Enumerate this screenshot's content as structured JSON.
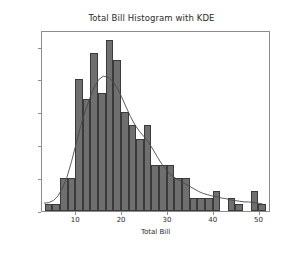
{
  "chart_data": {
    "type": "bar",
    "title": "Total Bill Histogram with KDE",
    "xlabel": "Total Bill",
    "ylabel": "Frequency",
    "xlim": [
      2.5,
      52.5
    ],
    "ylim": [
      0,
      27.5
    ],
    "xticks": [
      10,
      20,
      30,
      40,
      50
    ],
    "yticks": [
      0,
      5,
      10,
      15,
      20,
      25
    ],
    "grid": false,
    "legend": null,
    "bin_width": 1.667,
    "bin_edges": [
      3.07,
      4.74,
      6.4,
      8.07,
      9.74,
      11.4,
      13.07,
      14.74,
      16.4,
      18.07,
      19.74,
      21.4,
      23.07,
      24.74,
      26.4,
      28.07,
      29.74,
      31.4,
      33.07,
      34.74,
      36.4,
      38.07,
      39.74,
      41.4,
      43.07,
      44.74,
      46.4,
      48.07,
      49.74,
      51.4
    ],
    "categories": [
      "3.9",
      "5.6",
      "7.2",
      "8.9",
      "10.6",
      "12.2",
      "13.9",
      "15.6",
      "17.2",
      "18.9",
      "20.6",
      "22.2",
      "23.9",
      "25.6",
      "27.2",
      "28.9",
      "30.6",
      "32.2",
      "33.9",
      "35.6",
      "37.2",
      "38.9",
      "40.6",
      "42.2",
      "43.9",
      "45.6",
      "47.2",
      "48.9",
      "50.6"
    ],
    "values": [
      1,
      1,
      5,
      5,
      20,
      17,
      24,
      18,
      26,
      23,
      15,
      13,
      11,
      13,
      7,
      7,
      7,
      5,
      5,
      2,
      2,
      2,
      3,
      0,
      2,
      1,
      0,
      3,
      1
    ],
    "series": [
      {
        "name": "Histogram",
        "type": "bar",
        "color": "#6f6f6f",
        "edge_color": "#3a3a3a",
        "values": [
          1,
          1,
          5,
          5,
          20,
          17,
          24,
          18,
          26,
          23,
          15,
          13,
          11,
          13,
          7,
          7,
          7,
          5,
          5,
          2,
          2,
          2,
          3,
          0,
          2,
          1,
          0,
          3,
          1
        ]
      },
      {
        "name": "KDE",
        "type": "line",
        "color": "#4a4a4a",
        "x": [
          3.0,
          4.0,
          5.0,
          6.0,
          7.0,
          8.0,
          9.0,
          10.0,
          11.0,
          12.0,
          13.0,
          14.0,
          15.0,
          16.0,
          17.0,
          18.0,
          19.0,
          20.0,
          21.0,
          22.0,
          23.0,
          24.0,
          25.0,
          26.0,
          27.0,
          28.0,
          29.0,
          30.0,
          31.0,
          32.0,
          33.0,
          34.0,
          35.0,
          36.0,
          37.0,
          38.0,
          39.0,
          40.0,
          41.0,
          42.0,
          43.0,
          44.0,
          45.0,
          46.0,
          47.0,
          48.0,
          49.0,
          50.0,
          51.0
        ],
        "y": [
          1.2,
          1.3,
          1.6,
          2.3,
          3.5,
          5.2,
          7.6,
          10.3,
          13.0,
          15.3,
          17.3,
          19.0,
          20.2,
          20.7,
          20.6,
          20.0,
          19.0,
          17.6,
          16.0,
          14.5,
          13.2,
          12.2,
          11.4,
          10.5,
          9.4,
          8.2,
          7.1,
          6.2,
          5.5,
          5.0,
          4.6,
          4.2,
          3.8,
          3.4,
          3.0,
          2.7,
          2.5,
          2.3,
          2.2,
          2.0,
          1.9,
          1.7,
          1.6,
          1.5,
          1.4,
          1.4,
          1.3,
          1.2,
          1.1
        ]
      }
    ]
  }
}
